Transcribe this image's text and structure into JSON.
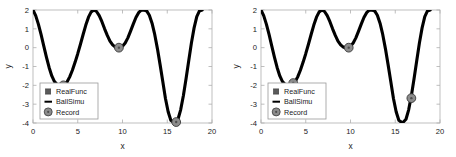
{
  "figure": {
    "background_color": "#ffffff",
    "panel_count": 2
  },
  "chart_data": [
    {
      "type": "line",
      "panel": "left",
      "title": "",
      "xlabel": "x",
      "ylabel": "y",
      "xlim": [
        0,
        20
      ],
      "ylim": [
        -4,
        2
      ],
      "xticks": [
        0,
        5,
        10,
        15,
        20
      ],
      "xticklabels": [
        "0",
        "5",
        "10",
        "15",
        "20"
      ],
      "yticks": [
        -4,
        -3,
        -2,
        -1,
        0,
        1,
        2
      ],
      "yticklabels": [
        "-4",
        "-3",
        "-2",
        "-1",
        "0",
        "1",
        "2"
      ],
      "grid": false,
      "legend_position": "lower left",
      "legend": [
        {
          "label": "RealFunc",
          "marker": "square",
          "color": "#5a5a5a"
        },
        {
          "label": "BallSimu",
          "marker": "line",
          "color": "#000000"
        },
        {
          "label": "Record",
          "marker": "circle",
          "color": "#8c8c8c"
        }
      ],
      "series": [
        {
          "name": "BallSimu",
          "color": "#000000",
          "linewidth": 3.1,
          "x": [
            0.0,
            0.3,
            0.6,
            0.9,
            1.2,
            1.5,
            1.8,
            2.1,
            2.4,
            2.7,
            3.0,
            3.4,
            3.8,
            4.1,
            4.4,
            4.7,
            5.0,
            5.3,
            5.6,
            5.9,
            6.2,
            6.5,
            6.8,
            7.1,
            7.4,
            7.7,
            8.0,
            8.3,
            8.6,
            8.9,
            9.2,
            9.6,
            10.0,
            10.3,
            10.6,
            10.9,
            11.2,
            11.5,
            11.8,
            12.1,
            12.4,
            12.7,
            13.0,
            13.3,
            13.6,
            13.9,
            14.2,
            14.5,
            14.8,
            15.1,
            15.4,
            15.8,
            16.2,
            16.5,
            16.8,
            17.1,
            17.4,
            17.7,
            18.0,
            18.3,
            18.6,
            18.9
          ],
          "y": [
            2.0,
            1.7,
            1.25,
            0.7,
            0.1,
            -0.5,
            -1.05,
            -1.5,
            -1.8,
            -1.96,
            -2.0,
            -1.99,
            -1.82,
            -1.55,
            -1.2,
            -0.78,
            -0.32,
            0.18,
            0.7,
            1.2,
            1.62,
            1.9,
            2.0,
            1.92,
            1.7,
            1.38,
            1.0,
            0.65,
            0.35,
            0.15,
            0.03,
            0.0,
            0.08,
            0.25,
            0.52,
            0.88,
            1.25,
            1.6,
            1.86,
            1.99,
            2.0,
            1.95,
            1.72,
            1.3,
            0.7,
            -0.05,
            -0.9,
            -1.8,
            -2.7,
            -3.4,
            -3.85,
            -4.0,
            -3.8,
            -3.3,
            -2.55,
            -1.65,
            -0.7,
            0.25,
            1.05,
            1.65,
            1.95,
            2.0
          ]
        },
        {
          "name": "Record",
          "color": "#8c8c8c",
          "marker": "circle",
          "points": [
            {
              "x": 3.4,
              "y": -2.0
            },
            {
              "x": 9.6,
              "y": 0.0
            },
            {
              "x": 16.0,
              "y": -3.95
            }
          ]
        }
      ]
    },
    {
      "type": "line",
      "panel": "right",
      "title": "",
      "xlabel": "x",
      "ylabel": "y",
      "xlim": [
        0,
        20
      ],
      "ylim": [
        -4,
        2
      ],
      "xticks": [
        0,
        5,
        10,
        15,
        20
      ],
      "xticklabels": [
        "0",
        "5",
        "10",
        "15",
        "20"
      ],
      "yticks": [
        -4,
        -3,
        -2,
        -1,
        0,
        1,
        2
      ],
      "yticklabels": [
        "-4",
        "-3",
        "-2",
        "-1",
        "0",
        "1",
        "2"
      ],
      "grid": false,
      "legend_position": "lower left",
      "legend": [
        {
          "label": "RealFunc",
          "marker": "square",
          "color": "#5a5a5a"
        },
        {
          "label": "BallSimu",
          "marker": "line",
          "color": "#000000"
        },
        {
          "label": "Record",
          "marker": "circle",
          "color": "#8c8c8c"
        }
      ],
      "series": [
        {
          "name": "BallSimu",
          "color": "#000000",
          "linewidth": 3.1,
          "x": [
            0.0,
            0.3,
            0.6,
            0.9,
            1.2,
            1.5,
            1.8,
            2.1,
            2.4,
            2.7,
            3.0,
            3.4,
            3.8,
            4.1,
            4.4,
            4.7,
            5.0,
            5.3,
            5.6,
            5.9,
            6.2,
            6.5,
            6.8,
            7.1,
            7.4,
            7.7,
            8.0,
            8.3,
            8.6,
            8.9,
            9.2,
            9.6,
            10.0,
            10.3,
            10.6,
            10.9,
            11.2,
            11.5,
            11.8,
            12.1,
            12.4,
            12.7,
            13.0,
            13.3,
            13.6,
            13.9,
            14.2,
            14.5,
            14.8,
            15.1,
            15.4,
            15.8,
            16.2,
            16.5,
            16.8,
            17.1,
            17.4,
            17.7,
            18.0,
            18.3,
            18.6,
            18.9
          ],
          "y": [
            2.0,
            1.7,
            1.25,
            0.7,
            0.1,
            -0.5,
            -1.05,
            -1.5,
            -1.8,
            -1.96,
            -2.0,
            -1.99,
            -1.82,
            -1.55,
            -1.2,
            -0.78,
            -0.32,
            0.18,
            0.7,
            1.2,
            1.62,
            1.9,
            2.0,
            1.92,
            1.7,
            1.38,
            1.0,
            0.65,
            0.35,
            0.15,
            0.03,
            0.0,
            0.08,
            0.25,
            0.52,
            0.88,
            1.25,
            1.6,
            1.86,
            1.99,
            2.0,
            1.95,
            1.72,
            1.3,
            0.7,
            -0.05,
            -0.9,
            -1.8,
            -2.7,
            -3.4,
            -3.85,
            -4.0,
            -3.8,
            -3.3,
            -2.55,
            -1.65,
            -0.7,
            0.25,
            1.05,
            1.65,
            1.95,
            2.0
          ]
        },
        {
          "name": "Record",
          "color": "#8c8c8c",
          "marker": "circle",
          "points": [
            {
              "x": 3.6,
              "y": -1.88
            },
            {
              "x": 9.8,
              "y": 0.0
            },
            {
              "x": 16.8,
              "y": -2.68
            }
          ]
        }
      ]
    }
  ]
}
